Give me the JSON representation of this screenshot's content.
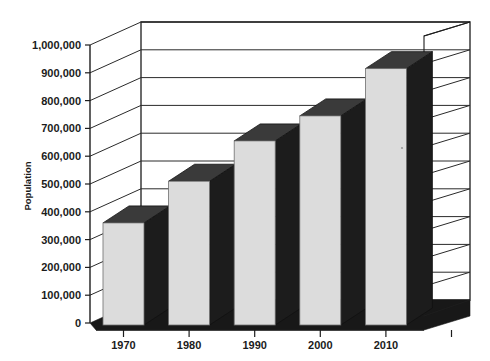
{
  "chart_data": {
    "type": "bar",
    "title": "",
    "subtitle": "",
    "xlabel": "",
    "ylabel": "Population",
    "categories": [
      "1970",
      "1980",
      "1990",
      "2000",
      "2010"
    ],
    "values": [
      360000,
      510000,
      655000,
      745000,
      915000
    ],
    "ylim": [
      0,
      1000000
    ],
    "ytick_values": [
      0,
      100000,
      200000,
      300000,
      400000,
      500000,
      600000,
      700000,
      800000,
      900000,
      1000000
    ],
    "ytick_labels": [
      "0",
      "100,000",
      "200,000",
      "300,000",
      "400,000",
      "500,000",
      "600,000",
      "700,000",
      "800,000",
      "900,000",
      "1,000,000"
    ],
    "grid": true,
    "grid_axis": "y",
    "legend": false,
    "legend_position": "none",
    "three_d": true,
    "colors": {
      "bar_front": "#dcdcdc",
      "bar_side": "#1c1c1c",
      "bar_top": "#3a3a3a",
      "floor": "#181818",
      "axis": "#1d1d1d",
      "grid": "#2a2a2a",
      "text": "#1b1b1b",
      "background": "#ffffff"
    }
  },
  "axes": {
    "y_axis_title": "Population",
    "x_axis_title": ""
  }
}
